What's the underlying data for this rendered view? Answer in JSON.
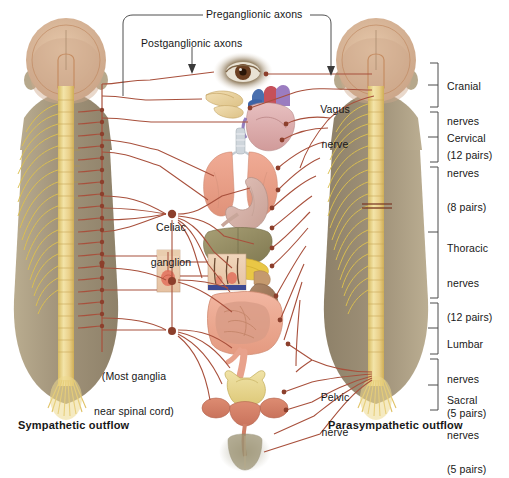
{
  "figure": {
    "title_left": "Sympathetic outflow",
    "title_right": "Parasympathetic outflow",
    "top_labels": {
      "preganglionic": "Preganglionic axons",
      "postganglionic": "Postganglionic axons"
    },
    "callouts": {
      "vagus": "Vagus\nnerve",
      "pelvic": "Pelvic\nnerve",
      "celiac": "Celiac\nganglion",
      "most_ganglia": "(Most ganglia\nnear spinal cord)"
    },
    "spinal_groups": [
      {
        "name": "Cranial",
        "line1": "Cranial",
        "line2": "nerves",
        "line3": "(12 pairs)"
      },
      {
        "name": "Cervical",
        "line1": "Cervical",
        "line2": "nerves",
        "line3": "(8 pairs)"
      },
      {
        "name": "Thoracic",
        "line1": "Thoracic",
        "line2": "nerves",
        "line3": "(12 pairs)"
      },
      {
        "name": "Lumbar",
        "line1": "Lumbar",
        "line2": "nerves",
        "line3": "(5 pairs)"
      },
      {
        "name": "Sacral",
        "line1": "Sacral",
        "line2": "nerves",
        "line3": "(5 pairs)"
      }
    ],
    "organs": [
      "eye",
      "salivary-glands",
      "heart",
      "lungs",
      "stomach",
      "liver",
      "pancreas",
      "kidney",
      "sweat-gland-skin",
      "hair-follicle-skin",
      "intestines",
      "bladder",
      "reproductive-organs"
    ],
    "colors": {
      "body": "#a79madd",
      "body_fill": "#a89a7c",
      "head_fill": "#d9b596",
      "spinal_cord": "#edd98f",
      "nerve_yellow": "#e0c355",
      "axon_red": "#a8503c",
      "ganglion": "#8c3f2c",
      "bracket": "#4a4a4a",
      "organ_pink": "#e8a390",
      "text": "#171717"
    }
  }
}
